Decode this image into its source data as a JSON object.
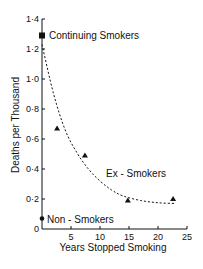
{
  "chart_data": {
    "type": "scatter",
    "title": "",
    "xlabel": "Years Stopped Smoking",
    "ylabel": "Deaths per Thousand",
    "xlim": [
      0,
      25
    ],
    "ylim": [
      0,
      1.4
    ],
    "grid": false,
    "x_ticks": [
      5,
      10,
      15,
      20,
      25
    ],
    "y_ticks": [
      0,
      0.2,
      0.4,
      0.6,
      0.8,
      1.0,
      1.2,
      1.4
    ],
    "y_tick_labels": [
      "0",
      "0·2",
      "0·4",
      "0·6",
      "0·8",
      "1·0",
      "1·2",
      "1·4"
    ],
    "x_tick_labels": [
      "5",
      "10",
      "15",
      "20",
      "25"
    ],
    "series": [
      {
        "name": "Continuing Smokers",
        "marker": "square",
        "points": [
          {
            "x": 0,
            "y": 1.29
          }
        ]
      },
      {
        "name": "Ex-Smokers",
        "marker": "triangle",
        "points": [
          {
            "x": 2.6,
            "y": 0.67
          },
          {
            "x": 7.4,
            "y": 0.49
          },
          {
            "x": 14.8,
            "y": 0.19
          },
          {
            "x": 22.6,
            "y": 0.2
          }
        ]
      },
      {
        "name": "Ex-Smokers fitted curve",
        "style": "dashed",
        "points": [
          {
            "x": 0,
            "y": 1.23
          },
          {
            "x": 2,
            "y": 0.9
          },
          {
            "x": 4,
            "y": 0.66
          },
          {
            "x": 6,
            "y": 0.51
          },
          {
            "x": 8,
            "y": 0.4
          },
          {
            "x": 10,
            "y": 0.32
          },
          {
            "x": 12,
            "y": 0.26
          },
          {
            "x": 14,
            "y": 0.22
          },
          {
            "x": 17,
            "y": 0.19
          },
          {
            "x": 20,
            "y": 0.175
          },
          {
            "x": 23,
            "y": 0.17
          }
        ]
      },
      {
        "name": "Non-Smokers",
        "marker": "circle",
        "points": [
          {
            "x": 0,
            "y": 0.07
          }
        ]
      }
    ],
    "annotations": [
      {
        "text": "Continuing Smokers",
        "x": 0.5,
        "y": 1.29
      },
      {
        "text": "Ex-Smokers",
        "x": 11,
        "y": 0.37
      },
      {
        "text": "Non-Smokers",
        "x": 0.5,
        "y": 0.07
      }
    ]
  },
  "labels": {
    "xlabel": "Years Stopped Smoking",
    "ylabel": "Deaths per Thousand",
    "continuing": "Continuing Smokers",
    "ex": "Ex-Smokers",
    "ex_display": "Ex - Smokers",
    "non": "Non - Smokers"
  }
}
